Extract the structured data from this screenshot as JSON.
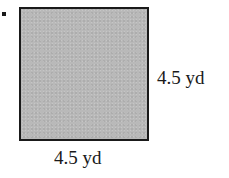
{
  "figure": {
    "shape": "square",
    "fill_color": "#b9b9b9",
    "border_color": "#1a1a1a",
    "problem_marker": ".",
    "dimensions": {
      "side_right": {
        "value": 4.5,
        "unit": "yd",
        "label": "4.5 yd"
      },
      "side_bottom": {
        "value": 4.5,
        "unit": "yd",
        "label": "4.5 yd"
      }
    }
  }
}
